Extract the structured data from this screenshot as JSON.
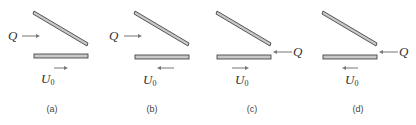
{
  "figure": {
    "panels": [
      {
        "id": "a",
        "caption": "(a)",
        "q_label": "Q",
        "u_label": "U",
        "u_sub": "0",
        "q_side": "left",
        "u_dir": "right"
      },
      {
        "id": "b",
        "caption": "(b)",
        "q_label": "Q",
        "u_label": "U",
        "u_sub": "0",
        "q_side": "left",
        "u_dir": "left"
      },
      {
        "id": "c",
        "caption": "(c)",
        "q_label": "Q",
        "u_label": "U",
        "u_sub": "0",
        "q_side": "right",
        "u_dir": "right"
      },
      {
        "id": "d",
        "caption": "(d)",
        "q_label": "Q",
        "u_label": "U",
        "u_sub": "0",
        "q_side": "right",
        "u_dir": "left"
      }
    ],
    "colors": {
      "plate_fill": "#c8c8c8",
      "plate_stroke": "#333333",
      "arrow": "#777777"
    }
  }
}
